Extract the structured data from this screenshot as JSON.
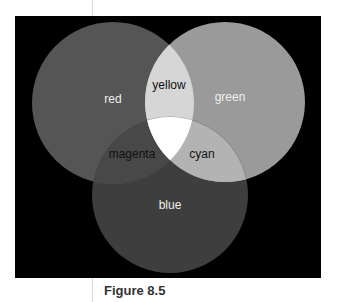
{
  "figure": {
    "caption": "Figure 8.5"
  },
  "circles": {
    "red": {
      "label": "red",
      "color": "#555555"
    },
    "green": {
      "label": "green",
      "color": "#9a9a9a"
    },
    "blue": {
      "label": "blue",
      "color": "#3e3e3e"
    }
  },
  "overlaps": {
    "yellow": {
      "label": "yellow",
      "color": "#d6d6d6"
    },
    "magenta": {
      "label": "magenta",
      "color": "#484848"
    },
    "cyan": {
      "label": "cyan",
      "color": "#b3b3b3"
    },
    "white": {
      "label": "",
      "color": "#ffffff"
    }
  }
}
